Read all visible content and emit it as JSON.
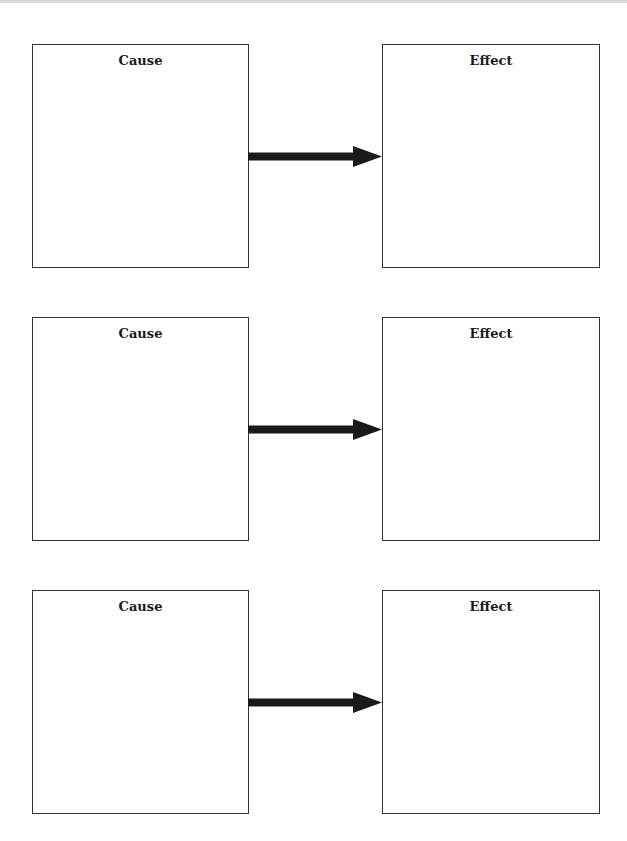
{
  "diagram": {
    "type": "cause-effect graphic organizer",
    "colors": {
      "border": "#333333",
      "arrow": "#1a1a1a",
      "background": "#ffffff"
    },
    "rows": [
      {
        "cause": {
          "label": "Cause",
          "content": ""
        },
        "effect": {
          "label": "Effect",
          "content": ""
        },
        "connector": "arrow-right"
      },
      {
        "cause": {
          "label": "Cause",
          "content": ""
        },
        "effect": {
          "label": "Effect",
          "content": ""
        },
        "connector": "arrow-right"
      },
      {
        "cause": {
          "label": "Cause",
          "content": ""
        },
        "effect": {
          "label": "Effect",
          "content": ""
        },
        "connector": "arrow-right"
      }
    ]
  }
}
